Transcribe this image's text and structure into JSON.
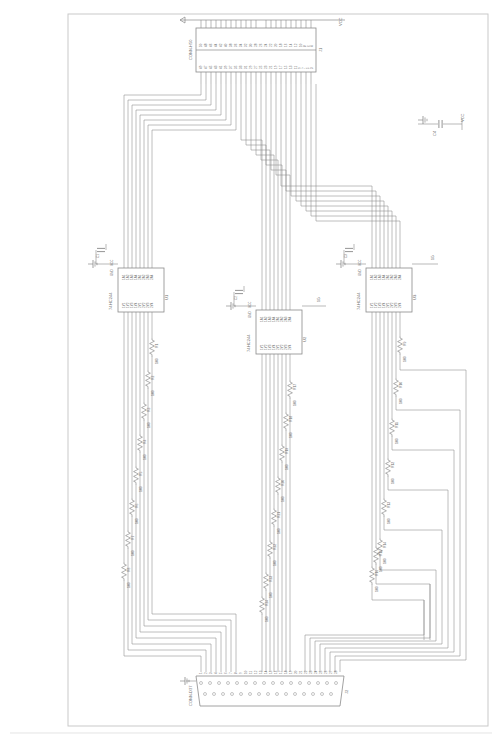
{
  "drawing": {
    "title": "Schematic Diagram",
    "orientation": "landscape-rotated",
    "border": {
      "present": true,
      "color": "#c9c9c9"
    },
    "sheet_size": {
      "width": 500,
      "height": 746
    }
  },
  "colors": {
    "wire": "#8a8a8a",
    "symbol": "#7a7a7a",
    "text": "#6b6b6b",
    "border": "#c9c9c9",
    "background": "#ffffff"
  },
  "connectors": [
    {
      "id": "header-top",
      "ref": "J1",
      "label": "CONN-H50",
      "type": "header",
      "pin_count": 50,
      "orientation": "horizontal",
      "pins_top": [
        "50",
        "48",
        "46",
        "44",
        "42",
        "40",
        "38",
        "36",
        "34",
        "32",
        "30",
        "28",
        "26",
        "24",
        "22",
        "20",
        "18",
        "16",
        "14",
        "12",
        "10",
        "8",
        "6",
        "4",
        "2"
      ],
      "pins_bottom": [
        "49",
        "47",
        "45",
        "43",
        "41",
        "39",
        "37",
        "35",
        "33",
        "31",
        "29",
        "27",
        "25",
        "23",
        "21",
        "19",
        "17",
        "15",
        "13",
        "11",
        "9",
        "7",
        "5",
        "3",
        "1"
      ],
      "net_label": "VCC"
    },
    {
      "id": "dsub-bottom",
      "ref": "J2",
      "label": "CONN-D37",
      "type": "d-subminiature",
      "pin_count": 37,
      "orientation": "horizontal",
      "pins": [
        "1",
        "2",
        "3",
        "4",
        "5",
        "6",
        "7",
        "8",
        "9",
        "10",
        "11",
        "12",
        "13",
        "14",
        "15",
        "16",
        "17",
        "18",
        "19",
        "20",
        "21",
        "22",
        "23",
        "24",
        "25",
        "26",
        "27",
        "28",
        "29",
        "30",
        "31",
        "32",
        "33",
        "34",
        "35",
        "36",
        "37"
      ]
    }
  ],
  "ics": [
    {
      "id": "u1",
      "ref": "U1",
      "part": "74HC244",
      "position": "left",
      "inputs": [
        "1A1",
        "1A2",
        "1A3",
        "1A4",
        "2A1",
        "2A2",
        "2A3",
        "2A4"
      ],
      "outputs": [
        "1Y1",
        "1Y2",
        "1Y3",
        "1Y4",
        "2Y1",
        "2Y2",
        "2Y3",
        "2Y4"
      ],
      "pins_in": [
        "2",
        "4",
        "6",
        "8",
        "11",
        "13",
        "15",
        "17"
      ],
      "pins_out": [
        "18",
        "16",
        "14",
        "12",
        "9",
        "7",
        "5",
        "3"
      ],
      "enable_pins": [
        "1",
        "19"
      ],
      "enable_labels": [
        "1G",
        "2G"
      ],
      "power": {
        "vcc_pin": "20",
        "gnd_pin": "10",
        "vcc_label": "VCC",
        "gnd_label": "GND"
      },
      "decoupling_cap": {
        "ref": "C1",
        "value": "100n"
      }
    },
    {
      "id": "u2",
      "ref": "U2",
      "part": "74HC244",
      "position": "center",
      "inputs": [
        "1A1",
        "1A2",
        "1A3",
        "1A4",
        "2A1",
        "2A2",
        "2A3",
        "2A4"
      ],
      "outputs": [
        "1Y1",
        "1Y2",
        "1Y3",
        "1Y4",
        "2Y1",
        "2Y2",
        "2Y3",
        "2Y4"
      ],
      "pins_in": [
        "2",
        "4",
        "6",
        "8",
        "11",
        "13",
        "15",
        "17"
      ],
      "pins_out": [
        "18",
        "16",
        "14",
        "12",
        "9",
        "7",
        "5",
        "3"
      ],
      "enable_pins": [
        "1",
        "19"
      ],
      "enable_labels": [
        "1G",
        "2G"
      ],
      "power": {
        "vcc_pin": "20",
        "gnd_pin": "10",
        "vcc_label": "VCC",
        "gnd_label": "GND"
      },
      "decoupling_cap": {
        "ref": "C2",
        "value": "100n"
      }
    },
    {
      "id": "u3",
      "ref": "U3",
      "part": "74HC244",
      "position": "right",
      "inputs": [
        "1A1",
        "1A2",
        "1A3",
        "1A4",
        "2A1",
        "2A2",
        "2A3",
        "2A4"
      ],
      "outputs": [
        "1Y1",
        "1Y2",
        "1Y3",
        "1Y4",
        "2Y1",
        "2Y2",
        "2Y3",
        "2Y4"
      ],
      "pins_in": [
        "2",
        "4",
        "6",
        "8",
        "11",
        "13",
        "15",
        "17"
      ],
      "pins_out": [
        "18",
        "16",
        "14",
        "12",
        "9",
        "7",
        "5",
        "3"
      ],
      "enable_pins": [
        "1",
        "19"
      ],
      "enable_labels": [
        "1G",
        "2G"
      ],
      "power": {
        "vcc_pin": "20",
        "gnd_pin": "10",
        "vcc_label": "VCC",
        "gnd_label": "GND"
      },
      "decoupling_cap": {
        "ref": "C3",
        "value": "100n"
      }
    }
  ],
  "capacitors": [
    {
      "ref": "C4",
      "value": "100n",
      "position": "top-right",
      "net": "VCC"
    }
  ],
  "resistor_bank_right": [
    {
      "ref": "R9",
      "value": "100"
    },
    {
      "ref": "R10",
      "value": "100"
    },
    {
      "ref": "R11",
      "value": "100"
    },
    {
      "ref": "R12",
      "value": "100"
    },
    {
      "ref": "R13",
      "value": "100"
    },
    {
      "ref": "R14",
      "value": "100"
    },
    {
      "ref": "R15",
      "value": "100"
    },
    {
      "ref": "R16",
      "value": "100"
    }
  ],
  "resistor_bank_center": [
    {
      "ref": "R17",
      "value": "100"
    },
    {
      "ref": "R18",
      "value": "100"
    },
    {
      "ref": "R19",
      "value": "100"
    },
    {
      "ref": "R20",
      "value": "100"
    },
    {
      "ref": "R21",
      "value": "100"
    },
    {
      "ref": "R22",
      "value": "100"
    },
    {
      "ref": "R23",
      "value": "100"
    },
    {
      "ref": "R24",
      "value": "100"
    }
  ],
  "resistor_bank_left": [
    {
      "ref": "R1",
      "value": "100"
    },
    {
      "ref": "R2",
      "value": "100"
    },
    {
      "ref": "R3",
      "value": "100"
    },
    {
      "ref": "R4",
      "value": "100"
    },
    {
      "ref": "R5",
      "value": "100"
    },
    {
      "ref": "R6",
      "value": "100"
    },
    {
      "ref": "R7",
      "value": "100"
    },
    {
      "ref": "R8",
      "value": "100"
    }
  ],
  "net_labels": [
    {
      "text": "VCC",
      "position": "top-right-header"
    },
    {
      "text": "VCC",
      "position": "u1-power"
    },
    {
      "text": "VCC",
      "position": "u2-power"
    },
    {
      "text": "VCC",
      "position": "u3-power"
    },
    {
      "text": "VCC",
      "position": "cap-c4"
    },
    {
      "text": "GND",
      "position": "u1-gnd"
    },
    {
      "text": "GND",
      "position": "u2-gnd"
    },
    {
      "text": "GND",
      "position": "u3-gnd"
    }
  ]
}
